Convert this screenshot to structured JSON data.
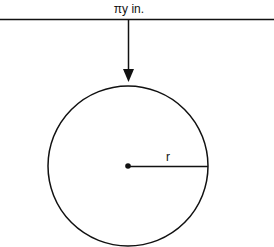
{
  "diagram": {
    "top_label": "πy in.",
    "radius_label": "r",
    "colors": {
      "stroke": "#111111",
      "background": "#ffffff"
    }
  }
}
